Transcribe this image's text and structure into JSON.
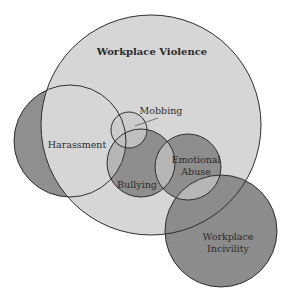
{
  "diagram": {
    "type": "venn",
    "colors": {
      "light_fill": "#d6d6d6",
      "dark_fill": "#8c8c8c",
      "overlap_fill": "#b4b4b4",
      "stroke": "#2e2e2e",
      "background": "#ffffff"
    },
    "sets": [
      {
        "id": "workplace-violence",
        "label": "Workplace Violence",
        "cx": 151,
        "cy": 125,
        "r": 110
      },
      {
        "id": "harassment",
        "label": "Harassment",
        "cx": 70,
        "cy": 141,
        "r": 56
      },
      {
        "id": "mobbing",
        "label": "Mobbing",
        "cx": 129,
        "cy": 130,
        "r": 18
      },
      {
        "id": "bullying",
        "label": "Bullying",
        "cx": 141,
        "cy": 163,
        "r": 34
      },
      {
        "id": "emotional-abuse",
        "label_line1": "Emotional",
        "label_line2": "Abuse",
        "cx": 188,
        "cy": 167,
        "r": 33
      },
      {
        "id": "workplace-incivility",
        "label_line1": "Workplace",
        "label_line2": "Incivility",
        "cx": 221,
        "cy": 231,
        "r": 56
      }
    ]
  }
}
